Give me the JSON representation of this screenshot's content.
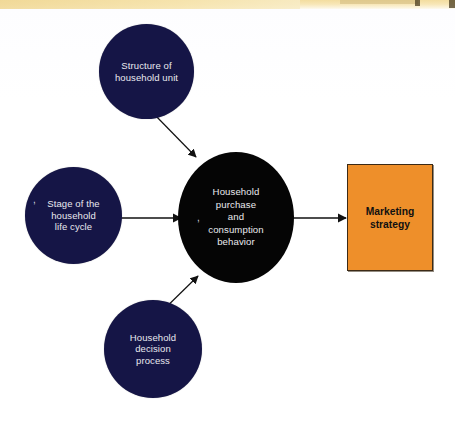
{
  "diagram": {
    "type": "influence-flow-diagram",
    "background_color": "#ffffff",
    "nodes": [
      {
        "id": "structure",
        "label": "Structure of\nhousehold unit",
        "shape": "circle",
        "fill": "#151546",
        "text_color": "#e9e9ef"
      },
      {
        "id": "stage",
        "label": "Stage of the\nhousehold\nlife cycle",
        "shape": "circle",
        "fill": "#151546",
        "text_color": "#e9e9ef"
      },
      {
        "id": "center",
        "label": "Household\npurchase\nand\nconsumption\nbehavior",
        "shape": "circle",
        "fill": "#050505",
        "text_color": "#eaeaee"
      },
      {
        "id": "decision",
        "label": "Household\ndecision\nprocess",
        "shape": "circle",
        "fill": "#151546",
        "text_color": "#e9e9ef"
      },
      {
        "id": "strategy",
        "label": "Marketing\nstrategy",
        "shape": "rectangle",
        "fill": "#ee8f2a",
        "text_color": "#111111",
        "border_color": "#3b2a16"
      }
    ],
    "edges": [
      {
        "from": "structure",
        "to": "center",
        "style": "arrow",
        "color": "#111111"
      },
      {
        "from": "stage",
        "to": "center",
        "style": "arrow",
        "color": "#111111"
      },
      {
        "from": "decision",
        "to": "center",
        "style": "arrow",
        "color": "#111111"
      },
      {
        "from": "center",
        "to": "strategy",
        "style": "arrow",
        "color": "#111111"
      }
    ],
    "artifacts": {
      "stage_comma": ",",
      "center_comma": ","
    }
  }
}
